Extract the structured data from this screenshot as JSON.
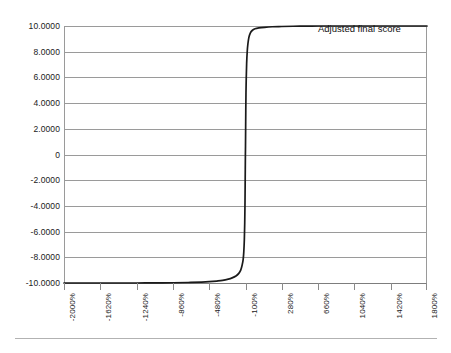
{
  "chart_data": {
    "type": "line",
    "title": "",
    "subtitle": "",
    "xlabel": "",
    "ylabel": "",
    "annotation": "Adjusted final score",
    "series_name": "Adjusted final score",
    "grid": true,
    "grid_axis": "y",
    "legend_position": "inside-top-right",
    "line_color": "#1a1a1a",
    "grid_color": "#9a9a9a",
    "background_color": "#ffffff",
    "xlim": [
      -2000,
      1800
    ],
    "ylim": [
      -10,
      10
    ],
    "x_tick_labels": [
      "-2000%",
      "-1620%",
      "-1240%",
      "-860%",
      "-480%",
      "-100%",
      "280%",
      "660%",
      "1040%",
      "1420%",
      "1800%"
    ],
    "x_tick_values": [
      -2000,
      -1620,
      -1240,
      -860,
      -480,
      -100,
      280,
      660,
      1040,
      1420,
      1800
    ],
    "x_tick_step": 380,
    "y_tick_labels": [
      "10.0000",
      "8.0000",
      "6.0000",
      "4.0000",
      "2.0000",
      "0",
      "-2.0000",
      "-4.0000",
      "-6.0000",
      "-8.0000",
      "-10.0000"
    ],
    "y_tick_values": [
      10,
      8,
      6,
      4,
      2,
      0,
      -2,
      -4,
      -6,
      -8,
      -10
    ],
    "x": [
      -2000,
      -1800,
      -1620,
      -1440,
      -1240,
      -1060,
      -860,
      -700,
      -560,
      -480,
      -400,
      -340,
      -280,
      -240,
      -200,
      -170,
      -150,
      -135,
      -125,
      -118,
      -112,
      -108,
      -105,
      -103,
      -101,
      -100,
      -99,
      -97,
      -95,
      -92,
      -88,
      -82,
      -75,
      -65,
      -50,
      -30,
      0,
      40,
      100,
      180,
      280,
      400,
      540,
      660,
      820,
      1040,
      1240,
      1420,
      1600,
      1800
    ],
    "y": [
      -10.0,
      -10.0,
      -10.0,
      -10.0,
      -10.0,
      -9.99,
      -9.98,
      -9.96,
      -9.93,
      -9.9,
      -9.85,
      -9.8,
      -9.7,
      -9.6,
      -9.45,
      -9.25,
      -9.0,
      -8.6,
      -8.2,
      -7.6,
      -6.6,
      -5.3,
      -3.6,
      -1.8,
      0.0,
      0.6,
      1.6,
      3.4,
      4.8,
      6.0,
      7.1,
      8.0,
      8.6,
      9.1,
      9.45,
      9.65,
      9.78,
      9.85,
      9.9,
      9.94,
      9.96,
      9.98,
      9.99,
      10.0,
      10.0,
      10.0,
      10.0,
      10.0,
      10.0,
      10.0
    ]
  }
}
